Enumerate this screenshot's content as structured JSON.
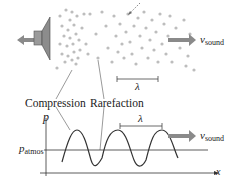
{
  "diagram": {
    "top": {
      "velocity_label": "v",
      "velocity_sub": "sound",
      "wavelength_label": "λ"
    },
    "labels": {
      "compression": "Compression",
      "rarefaction": "Rarefaction"
    },
    "graph": {
      "y_axis": "p",
      "x_axis": "x",
      "ref_label": "p",
      "ref_sub": "atmos",
      "wavelength_label": "λ",
      "velocity_label": "v",
      "velocity_sub": "sound"
    },
    "colors": {
      "arrow": "#8a8a8a",
      "particles": "#b8b8b8",
      "lines": "#444444"
    }
  }
}
